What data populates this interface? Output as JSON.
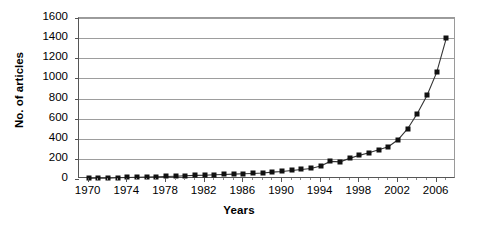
{
  "chart_data": {
    "type": "line",
    "title": "",
    "xlabel": "Years",
    "ylabel": "No. of articles",
    "xlim": [
      1969,
      2008
    ],
    "ylim": [
      0,
      1600
    ],
    "ytick_values": [
      0,
      200,
      400,
      600,
      800,
      1000,
      1200,
      1400,
      1600
    ],
    "ytick_labels": [
      "0",
      "200",
      "400",
      "600",
      "800",
      "1000",
      "1200",
      "1400",
      "1600"
    ],
    "xtick_values": [
      1970,
      1974,
      1978,
      1982,
      1986,
      1990,
      1994,
      1998,
      2002,
      2006
    ],
    "xtick_labels": [
      "1970",
      "1974",
      "1978",
      "1982",
      "1986",
      "1990",
      "1994",
      "1998",
      "2002",
      "2006"
    ],
    "grid": "horizontal",
    "legend": "none",
    "marker": "square",
    "marker_color": "#111111",
    "line_color": "#333333",
    "x": [
      1970,
      1971,
      1972,
      1973,
      1974,
      1975,
      1976,
      1977,
      1978,
      1979,
      1980,
      1981,
      1982,
      1983,
      1984,
      1985,
      1986,
      1987,
      1988,
      1989,
      1990,
      1991,
      1992,
      1993,
      1994,
      1995,
      1996,
      1997,
      1998,
      1999,
      2000,
      2001,
      2002,
      2003,
      2004,
      2005,
      2006,
      2007
    ],
    "values": [
      5,
      10,
      8,
      12,
      15,
      18,
      20,
      22,
      25,
      28,
      32,
      36,
      38,
      42,
      45,
      48,
      52,
      55,
      60,
      68,
      75,
      85,
      95,
      105,
      130,
      175,
      170,
      205,
      235,
      260,
      290,
      320,
      390,
      500,
      650,
      830,
      1060,
      1400
    ]
  }
}
